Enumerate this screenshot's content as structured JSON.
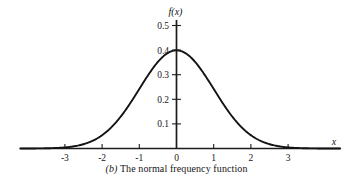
{
  "figure": {
    "caption_tag": "(b)",
    "caption_text": "The normal frequency function"
  },
  "chart_data": {
    "type": "line",
    "title": "",
    "subtitle": "",
    "xlabel": "x",
    "ylabel": "f(x)",
    "xlim": [
      -4.2,
      4.4
    ],
    "ylim": [
      0,
      0.55
    ],
    "xticks": [
      -3,
      -2,
      -1,
      0,
      1,
      2,
      3
    ],
    "xtick_labels": [
      "-3",
      "-2",
      "-1",
      "0",
      "1",
      "2",
      "3"
    ],
    "yticks": [
      0.1,
      0.2,
      0.3,
      0.4,
      0.5
    ],
    "ytick_labels": [
      "0.1",
      "0.2",
      "0.3",
      "0.4",
      "0.5"
    ],
    "grid": false,
    "legend": false,
    "series": [
      {
        "name": "standard normal density",
        "formula": "f(x) = (1/sqrt(2*pi)) * exp(-x^2/2)",
        "mean": 0,
        "sigma": 1,
        "peak_value": 0.3989,
        "x": [
          -4.2,
          -4.0,
          -3.8,
          -3.6,
          -3.4,
          -3.2,
          -3.0,
          -2.8,
          -2.6,
          -2.4,
          -2.2,
          -2.0,
          -1.8,
          -1.6,
          -1.4,
          -1.2,
          -1.0,
          -0.8,
          -0.6,
          -0.4,
          -0.2,
          0.0,
          0.2,
          0.4,
          0.6,
          0.8,
          1.0,
          1.2,
          1.4,
          1.6,
          1.8,
          2.0,
          2.2,
          2.4,
          2.6,
          2.8,
          3.0,
          3.2,
          3.4,
          3.6,
          3.8,
          4.0,
          4.2
        ],
        "y": [
          0.0001,
          0.0001,
          0.0003,
          0.0006,
          0.0012,
          0.0024,
          0.0044,
          0.0079,
          0.0136,
          0.0224,
          0.0355,
          0.054,
          0.079,
          0.1109,
          0.1497,
          0.1942,
          0.242,
          0.2897,
          0.3332,
          0.3683,
          0.391,
          0.3989,
          0.391,
          0.3683,
          0.3332,
          0.2897,
          0.242,
          0.1942,
          0.1497,
          0.1109,
          0.079,
          0.054,
          0.0355,
          0.0224,
          0.0136,
          0.0079,
          0.0044,
          0.0024,
          0.0012,
          0.0006,
          0.0003,
          0.0001,
          0.0001
        ]
      }
    ]
  }
}
